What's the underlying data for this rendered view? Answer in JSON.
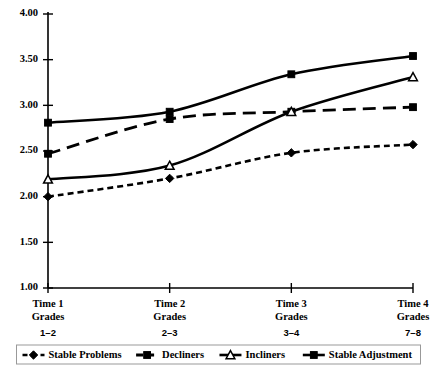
{
  "chart_data": {
    "type": "line",
    "title": "",
    "xlabel": "",
    "ylabel": "",
    "ylim": [
      1.0,
      4.0
    ],
    "grid": false,
    "legend_position": "bottom",
    "yticks": [
      "1.00",
      "1.50",
      "2.00",
      "2.50",
      "3.00",
      "3.50",
      "4.00"
    ],
    "ytick_values": [
      1.0,
      1.5,
      2.0,
      2.5,
      3.0,
      3.5,
      4.0
    ],
    "categories": [
      "Time 1",
      "Time 2",
      "Time 3",
      "Time 4"
    ],
    "category_sub": [
      "Grades",
      "Grades",
      "Grades",
      "Grades"
    ],
    "category_sub2": [
      "1–2",
      "2–3",
      "3–4",
      "7–8"
    ],
    "series": [
      {
        "name": "Stable Problems",
        "marker": "diamond",
        "dash": "dotted",
        "values": [
          2.0,
          2.2,
          2.48,
          2.57
        ]
      },
      {
        "name": "Decliners",
        "marker": "square",
        "dash": "dashed",
        "values": [
          2.47,
          2.85,
          2.93,
          2.98
        ]
      },
      {
        "name": "Incliners",
        "marker": "open-triangle",
        "dash": "solid",
        "values": [
          2.19,
          2.34,
          2.93,
          3.31
        ]
      },
      {
        "name": "Stable Adjustment",
        "marker": "square",
        "dash": "solid",
        "values": [
          2.81,
          2.93,
          3.34,
          3.54
        ]
      }
    ]
  },
  "legend": {
    "items": [
      {
        "label": "Stable Problems"
      },
      {
        "label": "Decliners"
      },
      {
        "label": "Incliners"
      },
      {
        "label": "Stable Adjustment"
      }
    ]
  },
  "colors": {
    "ink": "#000000",
    "background": "#ffffff",
    "legend_border": "#999999"
  }
}
